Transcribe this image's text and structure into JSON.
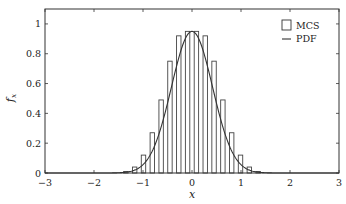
{
  "chart_data": {
    "type": "bar",
    "title": "",
    "xlabel": "x",
    "ylabel": "f_x",
    "xlim": [
      -3,
      3
    ],
    "ylim": [
      0,
      1.1
    ],
    "xticks": [
      -3,
      -2,
      -1,
      0,
      1,
      2,
      3
    ],
    "xtick_labels": [
      "−3",
      "−2",
      "−1",
      "0",
      "1",
      "2",
      "3"
    ],
    "yticks": [
      0,
      0.2,
      0.4,
      0.6,
      0.8,
      1
    ],
    "ytick_labels": [
      "0",
      "0.2",
      "0.4",
      "0.6",
      "0.8",
      "1"
    ],
    "grid": false,
    "legend": {
      "position": "upper right",
      "entries": [
        "MCS",
        "PDF"
      ]
    },
    "series": [
      {
        "name": "MCS",
        "kind": "histogram",
        "bin_width": 0.18,
        "bar_width_fraction": 0.5,
        "x": [
          -1.35,
          -1.17,
          -0.99,
          -0.81,
          -0.63,
          -0.45,
          -0.27,
          -0.09,
          0.09,
          0.27,
          0.45,
          0.63,
          0.81,
          0.99,
          1.17,
          1.35
        ],
        "values": [
          0.01,
          0.04,
          0.12,
          0.27,
          0.49,
          0.75,
          0.92,
          0.95,
          0.95,
          0.92,
          0.75,
          0.49,
          0.27,
          0.12,
          0.04,
          0.01
        ]
      },
      {
        "name": "PDF",
        "kind": "line",
        "distribution": "normal",
        "mean": 0,
        "std": 0.42,
        "peak": 0.95
      }
    ]
  }
}
